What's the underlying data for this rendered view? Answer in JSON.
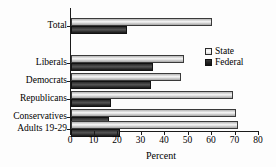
{
  "chart_data": {
    "type": "bar",
    "orientation": "horizontal",
    "title": "",
    "xlabel": "Percent",
    "ylabel": "",
    "xlim": [
      0,
      80
    ],
    "xticks": [
      0,
      10,
      20,
      30,
      40,
      50,
      60,
      70,
      80
    ],
    "grid": false,
    "legend_position": "right",
    "categories": [
      "Total",
      "Liberals",
      "Democrats",
      "Republicans",
      "Conservatives",
      "Adults 19-29"
    ],
    "series": [
      {
        "name": "State",
        "color": "#e0e0e0",
        "values": [
          60,
          48,
          47,
          69,
          70,
          71
        ]
      },
      {
        "name": "Federal",
        "color": "#2a2a2a",
        "values": [
          24,
          35,
          34,
          17,
          16,
          21
        ]
      }
    ]
  },
  "axis": {
    "x_title": "Percent",
    "tick_labels": [
      "0",
      "10",
      "20",
      "30",
      "40",
      "50",
      "60",
      "70",
      "80"
    ]
  },
  "legend": {
    "items": [
      {
        "label": "State"
      },
      {
        "label": "Federal"
      }
    ]
  }
}
